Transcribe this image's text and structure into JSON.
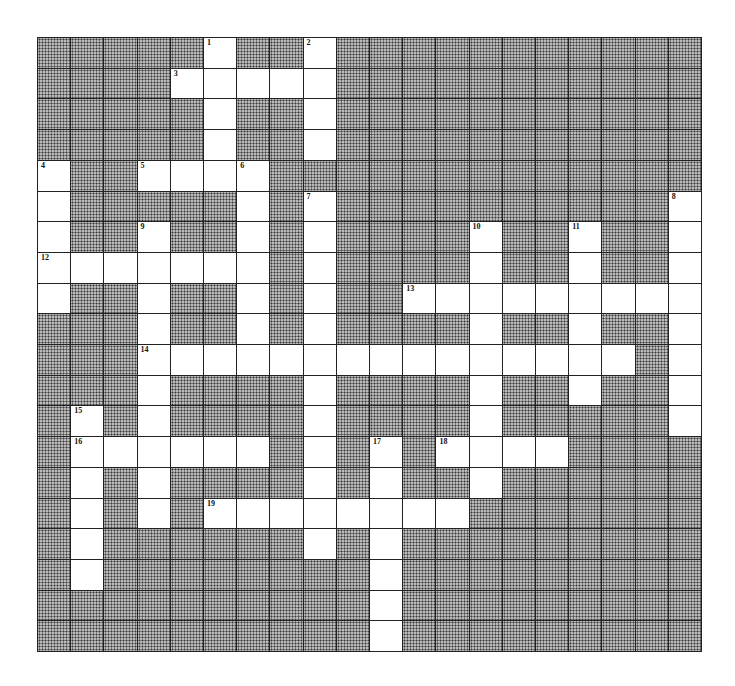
{
  "puzzle": {
    "rows": 20,
    "cols": 20,
    "grid": [
      "#####.##.###########",
      "####.....###########",
      "#####.##.###########",
      "#####.##.###########",
      ".##....#############",
      ".#####.#.##########.",
      ".##.##.#.####.##.##.",
      ".......#.####.##.##.",
      ".##.##.#.##.........",
      "###.##.#.####.##.##.",
      "###...............#.",
      "###.####.####.##.##.",
      "#.#.####.####.#####.",
      "#......#.#.#....####",
      "#.#.####.#.##.######",
      "#.#.#........#######",
      "#.######.#.#########",
      "#.########.#########",
      "##########.#########",
      "##########.#########"
    ],
    "numbers": [
      {
        "n": "1",
        "r": 0,
        "c": 5
      },
      {
        "n": "2",
        "r": 0,
        "c": 8
      },
      {
        "n": "3",
        "r": 1,
        "c": 4
      },
      {
        "n": "4",
        "r": 4,
        "c": 0
      },
      {
        "n": "5",
        "r": 4,
        "c": 3
      },
      {
        "n": "6",
        "r": 4,
        "c": 6
      },
      {
        "n": "7",
        "r": 5,
        "c": 8
      },
      {
        "n": "8",
        "r": 5,
        "c": 19
      },
      {
        "n": "9",
        "r": 6,
        "c": 3
      },
      {
        "n": "10",
        "r": 6,
        "c": 13
      },
      {
        "n": "11",
        "r": 6,
        "c": 16
      },
      {
        "n": "12",
        "r": 7,
        "c": 0
      },
      {
        "n": "13",
        "r": 8,
        "c": 11
      },
      {
        "n": "14",
        "r": 10,
        "c": 3
      },
      {
        "n": "15",
        "r": 12,
        "c": 1
      },
      {
        "n": "16",
        "r": 13,
        "c": 1
      },
      {
        "n": "17",
        "r": 13,
        "c": 10
      },
      {
        "n": "18",
        "r": 13,
        "c": 12
      },
      {
        "n": "19",
        "r": 15,
        "c": 5
      }
    ]
  }
}
